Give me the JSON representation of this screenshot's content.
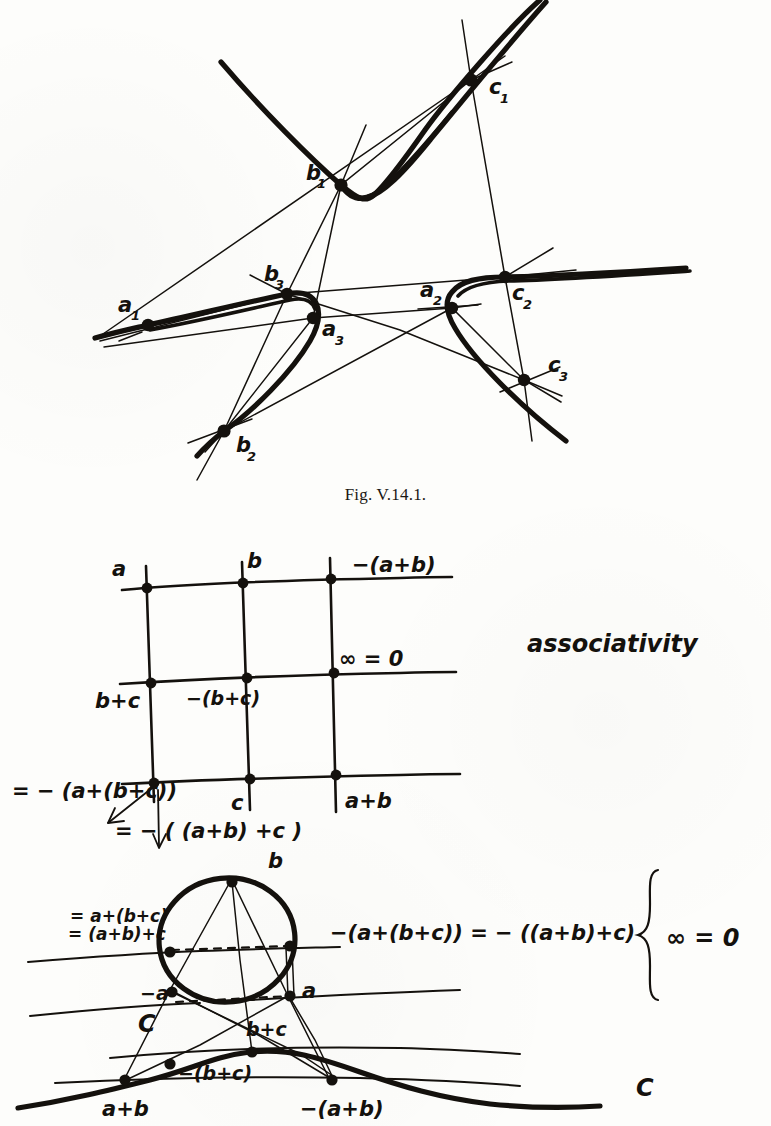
{
  "page": {
    "background_color": "#fdfdfb",
    "ink_color": "#14110d"
  },
  "figure_top": {
    "caption": "Fig. V.14.1.",
    "point_labels": [
      {
        "id": "a1",
        "base": "a",
        "sub": "1",
        "x": 118,
        "y": 312
      },
      {
        "id": "a2",
        "base": "a",
        "sub": "2",
        "x": 420,
        "y": 297
      },
      {
        "id": "a3",
        "base": "a",
        "sub": "3",
        "x": 322,
        "y": 336
      },
      {
        "id": "b1",
        "base": "b",
        "sub": "1",
        "x": 306,
        "y": 180
      },
      {
        "id": "b2",
        "base": "b",
        "sub": "2",
        "x": 236,
        "y": 452
      },
      {
        "id": "b3",
        "base": "b",
        "sub": "3",
        "x": 268,
        "y": 281
      },
      {
        "id": "c1",
        "base": "c",
        "sub": "1",
        "x": 489,
        "y": 90
      },
      {
        "id": "c2",
        "base": "c",
        "sub": "2",
        "x": 512,
        "y": 300
      },
      {
        "id": "c3",
        "base": "c",
        "sub": "3",
        "x": 548,
        "y": 372
      }
    ],
    "nodes": [
      {
        "id": "a1",
        "x": 148,
        "y": 325
      },
      {
        "id": "a2",
        "x": 452,
        "y": 308
      },
      {
        "id": "a3",
        "x": 313,
        "y": 318
      },
      {
        "id": "b1",
        "x": 341,
        "y": 185
      },
      {
        "id": "b2",
        "x": 224,
        "y": 431
      },
      {
        "id": "b3",
        "x": 287,
        "y": 294
      },
      {
        "id": "c1",
        "x": 471,
        "y": 80
      },
      {
        "id": "c2",
        "x": 505,
        "y": 277
      },
      {
        "id": "c3",
        "x": 524,
        "y": 380
      }
    ]
  },
  "figure_grid": {
    "note": "associativity",
    "labels": {
      "a": "a",
      "b": "b",
      "minus_a_plus_b": "−(a+b)",
      "infinity_zero": "∞ = 0",
      "b_plus_c": "b+c",
      "minus_b_plus_c": "−(b+c)",
      "c": "c",
      "a_plus_b": "a+b"
    },
    "equations": [
      "= − (a+(b+c))",
      "= − ( (a+b) +c )"
    ]
  },
  "figure_circle": {
    "labels": {
      "eq_top_1": "= a+(b+c)",
      "eq_top_2": "= (a+b)+c",
      "b": "b",
      "eq_right": "−(a+(b+c)) = − ((a+b)+c)",
      "minus_a": "−a",
      "a": "a",
      "C_upper": "C",
      "b_plus_c": "b+c",
      "minus_b_plus_c": "−(b+c)",
      "a_plus_b": "a+b",
      "minus_a_plus_b": "−(a+b)",
      "infinity_zero": "∞ = 0",
      "C_right": "C"
    }
  }
}
